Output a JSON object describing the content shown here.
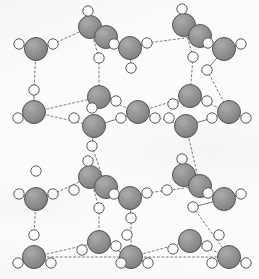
{
  "figure": {
    "background_color": "#fbfbfa"
  },
  "legend": {
    "oxygen_label": "O",
    "hydrogen_label": "H",
    "bond_label": "hydrogen bond"
  },
  "style": {
    "oxygen_fill": "#8f8f8f",
    "oxygen_stroke": "#4a4a4a",
    "oxygen_highlight": "#a8a8a8",
    "hydrogen_fill": "#fdfdfd",
    "hydrogen_stroke": "#555555",
    "bond_color": "#6e6e6e",
    "covalent_color": "#5a5a5a",
    "oxygen_radius": 11.5,
    "hydrogen_radius": 5.2,
    "bond_dash": "2,2.4"
  },
  "chart_data": {
    "type": "scatter",
    "xlabel": "",
    "ylabel": "",
    "xlim": [
      0,
      259
    ],
    "ylim": [
      0,
      279
    ],
    "grid": false,
    "legend": "none",
    "series": [
      {
        "name": "oxygen",
        "element": "O",
        "radius": 11.5,
        "color": "#8f8f8f",
        "points": [
          {
            "id": "O1",
            "x": 36,
            "y": 49,
            "layer": "top-front"
          },
          {
            "id": "O2",
            "x": 90,
            "y": 27,
            "layer": "top-back"
          },
          {
            "id": "O3",
            "x": 106,
            "y": 37,
            "layer": "top-back-overlap"
          },
          {
            "id": "O4",
            "x": 130,
            "y": 48,
            "layer": "top-front"
          },
          {
            "id": "O5",
            "x": 184,
            "y": 25,
            "layer": "top-back"
          },
          {
            "id": "O6",
            "x": 200,
            "y": 36,
            "layer": "top-back-overlap"
          },
          {
            "id": "O7",
            "x": 224,
            "y": 49,
            "layer": "top-front"
          },
          {
            "id": "O8",
            "x": 34,
            "y": 112,
            "layer": "mid-front"
          },
          {
            "id": "O9",
            "x": 99,
            "y": 97,
            "layer": "mid-back"
          },
          {
            "id": "O10",
            "x": 94,
            "y": 126,
            "layer": "mid-front"
          },
          {
            "id": "O11",
            "x": 138,
            "y": 112,
            "layer": "mid-mid"
          },
          {
            "id": "O12",
            "x": 190,
            "y": 96,
            "layer": "mid-back"
          },
          {
            "id": "O13",
            "x": 186,
            "y": 126,
            "layer": "mid-front"
          },
          {
            "id": "O14",
            "x": 229,
            "y": 112,
            "layer": "mid-mid"
          },
          {
            "id": "O15",
            "x": 36,
            "y": 199,
            "layer": "low-front"
          },
          {
            "id": "O16",
            "x": 90,
            "y": 177,
            "layer": "low-back"
          },
          {
            "id": "O17",
            "x": 106,
            "y": 187,
            "layer": "low-back-overlap"
          },
          {
            "id": "O18",
            "x": 130,
            "y": 198,
            "layer": "low-front"
          },
          {
            "id": "O19",
            "x": 184,
            "y": 175,
            "layer": "low-back"
          },
          {
            "id": "O20",
            "x": 200,
            "y": 186,
            "layer": "low-back-overlap"
          },
          {
            "id": "O21",
            "x": 224,
            "y": 199,
            "layer": "low-front"
          },
          {
            "id": "O22",
            "x": 34,
            "y": 257,
            "layer": "bot-front"
          },
          {
            "id": "O23",
            "x": 99,
            "y": 242,
            "layer": "bot-back"
          },
          {
            "id": "O24",
            "x": 131,
            "y": 257,
            "layer": "bot-front"
          },
          {
            "id": "O25",
            "x": 190,
            "y": 241,
            "layer": "bot-back"
          },
          {
            "id": "O26",
            "x": 229,
            "y": 257,
            "layer": "bot-mid"
          }
        ]
      },
      {
        "name": "hydrogen",
        "element": "H",
        "radius": 5.2,
        "color": "#fdfdfd",
        "points": [
          {
            "id": "H1",
            "x": 19,
            "y": 44
          },
          {
            "id": "H2",
            "x": 53,
            "y": 44
          },
          {
            "id": "H3",
            "x": 88,
            "y": 11
          },
          {
            "id": "H4",
            "x": 114,
            "y": 44
          },
          {
            "id": "H5",
            "x": 99,
            "y": 58
          },
          {
            "id": "H6",
            "x": 131,
            "y": 68
          },
          {
            "id": "H7",
            "x": 147,
            "y": 43
          },
          {
            "id": "H8",
            "x": 182,
            "y": 9
          },
          {
            "id": "H9",
            "x": 208,
            "y": 43
          },
          {
            "id": "H10",
            "x": 193,
            "y": 57
          },
          {
            "id": "H11",
            "x": 207,
            "y": 70
          },
          {
            "id": "H12",
            "x": 241,
            "y": 44
          },
          {
            "id": "H13",
            "x": 34,
            "y": 90
          },
          {
            "id": "H14",
            "x": 18,
            "y": 118
          },
          {
            "id": "H15",
            "x": 116,
            "y": 101
          },
          {
            "id": "H16",
            "x": 92,
            "y": 108
          },
          {
            "id": "H17",
            "x": 74,
            "y": 118
          },
          {
            "id": "H18",
            "x": 121,
            "y": 118
          },
          {
            "id": "H19",
            "x": 155,
            "y": 118
          },
          {
            "id": "H20",
            "x": 92,
            "y": 146
          },
          {
            "id": "H21",
            "x": 173,
            "y": 104
          },
          {
            "id": "H22",
            "x": 207,
            "y": 101
          },
          {
            "id": "H23",
            "x": 169,
            "y": 118
          },
          {
            "id": "H24",
            "x": 212,
            "y": 118
          },
          {
            "id": "H25",
            "x": 246,
            "y": 118
          },
          {
            "id": "H26",
            "x": 36,
            "y": 171
          },
          {
            "id": "H27",
            "x": 19,
            "y": 194
          },
          {
            "id": "H28",
            "x": 53,
            "y": 194
          },
          {
            "id": "H29",
            "x": 88,
            "y": 161
          },
          {
            "id": "H30",
            "x": 74,
            "y": 190
          },
          {
            "id": "H31",
            "x": 114,
            "y": 194
          },
          {
            "id": "H32",
            "x": 99,
            "y": 208
          },
          {
            "id": "H33",
            "x": 131,
            "y": 218
          },
          {
            "id": "H34",
            "x": 147,
            "y": 193
          },
          {
            "id": "H35",
            "x": 182,
            "y": 159
          },
          {
            "id": "H36",
            "x": 167,
            "y": 190
          },
          {
            "id": "H37",
            "x": 208,
            "y": 193
          },
          {
            "id": "H38",
            "x": 193,
            "y": 207
          },
          {
            "id": "H39",
            "x": 241,
            "y": 194
          },
          {
            "id": "H40",
            "x": 34,
            "y": 235
          },
          {
            "id": "H41",
            "x": 18,
            "y": 263
          },
          {
            "id": "H42",
            "x": 51,
            "y": 263
          },
          {
            "id": "H43",
            "x": 116,
            "y": 246
          },
          {
            "id": "H44",
            "x": 82,
            "y": 250
          },
          {
            "id": "H45",
            "x": 127,
            "y": 235
          },
          {
            "id": "H46",
            "x": 121,
            "y": 263
          },
          {
            "id": "H47",
            "x": 148,
            "y": 263
          },
          {
            "id": "H48",
            "x": 207,
            "y": 246
          },
          {
            "id": "H49",
            "x": 173,
            "y": 249
          },
          {
            "id": "H50",
            "x": 219,
            "y": 235
          },
          {
            "id": "H51",
            "x": 212,
            "y": 263
          },
          {
            "id": "H52",
            "x": 246,
            "y": 263
          }
        ]
      }
    ],
    "covalent_bonds": [
      {
        "from": "O1",
        "to": "H1"
      },
      {
        "from": "O1",
        "to": "H2"
      },
      {
        "from": "O2",
        "to": "H3"
      },
      {
        "from": "O3",
        "to": "H4"
      },
      {
        "from": "O4",
        "to": "H6"
      },
      {
        "from": "O4",
        "to": "H7"
      },
      {
        "from": "O5",
        "to": "H8"
      },
      {
        "from": "O6",
        "to": "H9"
      },
      {
        "from": "O7",
        "to": "H11"
      },
      {
        "from": "O7",
        "to": "H12"
      },
      {
        "from": "O8",
        "to": "H13"
      },
      {
        "from": "O8",
        "to": "H14"
      },
      {
        "from": "O9",
        "to": "H15"
      },
      {
        "from": "O9",
        "to": "H16"
      },
      {
        "from": "O10",
        "to": "H18"
      },
      {
        "from": "O10",
        "to": "H20"
      },
      {
        "from": "O11",
        "to": "H19"
      },
      {
        "from": "O11",
        "to": "H18"
      },
      {
        "from": "O12",
        "to": "H21"
      },
      {
        "from": "O12",
        "to": "H22"
      },
      {
        "from": "O13",
        "to": "H24"
      },
      {
        "from": "O14",
        "to": "H25"
      },
      {
        "from": "O15",
        "to": "H27"
      },
      {
        "from": "O15",
        "to": "H28"
      },
      {
        "from": "O16",
        "to": "H29"
      },
      {
        "from": "O17",
        "to": "H31"
      },
      {
        "from": "O18",
        "to": "H33"
      },
      {
        "from": "O18",
        "to": "H34"
      },
      {
        "from": "O19",
        "to": "H35"
      },
      {
        "from": "O20",
        "to": "H37"
      },
      {
        "from": "O21",
        "to": "H38"
      },
      {
        "from": "O21",
        "to": "H39"
      },
      {
        "from": "O22",
        "to": "H41"
      },
      {
        "from": "O22",
        "to": "H42"
      },
      {
        "from": "O23",
        "to": "H43"
      },
      {
        "from": "O24",
        "to": "H46"
      },
      {
        "from": "O24",
        "to": "H47"
      },
      {
        "from": "O25",
        "to": "H48"
      },
      {
        "from": "O26",
        "to": "H52"
      }
    ],
    "hydrogen_bonds": [
      {
        "from": "H2",
        "to": "O2",
        "kind": "diagonal"
      },
      {
        "from": "O1",
        "to": "H13",
        "kind": "vertical"
      },
      {
        "from": "O2",
        "to": "H5",
        "kind": "vertical"
      },
      {
        "from": "H5",
        "to": "O9",
        "kind": "vertical"
      },
      {
        "from": "O4",
        "to": "H6",
        "kind": "vertical"
      },
      {
        "from": "H7",
        "to": "O6",
        "kind": "diagonal"
      },
      {
        "from": "H4",
        "to": "O4",
        "kind": "diagonal"
      },
      {
        "from": "H9",
        "to": "O7",
        "kind": "diagonal"
      },
      {
        "from": "O5",
        "to": "H10",
        "kind": "vertical"
      },
      {
        "from": "H10",
        "to": "O12",
        "kind": "vertical"
      },
      {
        "from": "O7",
        "to": "H11",
        "kind": "vertical"
      },
      {
        "from": "H11",
        "to": "O14",
        "kind": "vertical"
      },
      {
        "from": "O8",
        "to": "O9",
        "kind": "perspective"
      },
      {
        "from": "O8",
        "to": "O10",
        "kind": "perspective"
      },
      {
        "from": "O9",
        "to": "O11",
        "kind": "perspective"
      },
      {
        "from": "O10",
        "to": "O11",
        "kind": "perspective"
      },
      {
        "from": "O11",
        "to": "O12",
        "kind": "perspective"
      },
      {
        "from": "O11",
        "to": "O13",
        "kind": "perspective"
      },
      {
        "from": "O12",
        "to": "O14",
        "kind": "perspective"
      },
      {
        "from": "O13",
        "to": "O14",
        "kind": "perspective"
      },
      {
        "from": "O10",
        "to": "H20",
        "kind": "vertical"
      },
      {
        "from": "H20",
        "to": "O17",
        "kind": "vertical"
      },
      {
        "from": "O13",
        "to": "O20",
        "kind": "vertical"
      },
      {
        "from": "H28",
        "to": "O16",
        "kind": "diagonal"
      },
      {
        "from": "H34",
        "to": "O20",
        "kind": "diagonal"
      },
      {
        "from": "O15",
        "to": "H40",
        "kind": "vertical"
      },
      {
        "from": "O16",
        "to": "H32",
        "kind": "vertical"
      },
      {
        "from": "H32",
        "to": "O23",
        "kind": "vertical"
      },
      {
        "from": "O18",
        "to": "H33",
        "kind": "vertical"
      },
      {
        "from": "H33",
        "to": "O24",
        "kind": "vertical"
      },
      {
        "from": "O21",
        "to": "H38",
        "kind": "vertical"
      },
      {
        "from": "H38",
        "to": "O26",
        "kind": "vertical"
      },
      {
        "from": "O22",
        "to": "O23",
        "kind": "perspective"
      },
      {
        "from": "O23",
        "to": "O24",
        "kind": "perspective"
      },
      {
        "from": "O24",
        "to": "O25",
        "kind": "perspective"
      },
      {
        "from": "O25",
        "to": "O26",
        "kind": "perspective"
      },
      {
        "from": "O22",
        "to": "O24",
        "kind": "perspective"
      },
      {
        "from": "O24",
        "to": "O26",
        "kind": "perspective"
      }
    ]
  }
}
